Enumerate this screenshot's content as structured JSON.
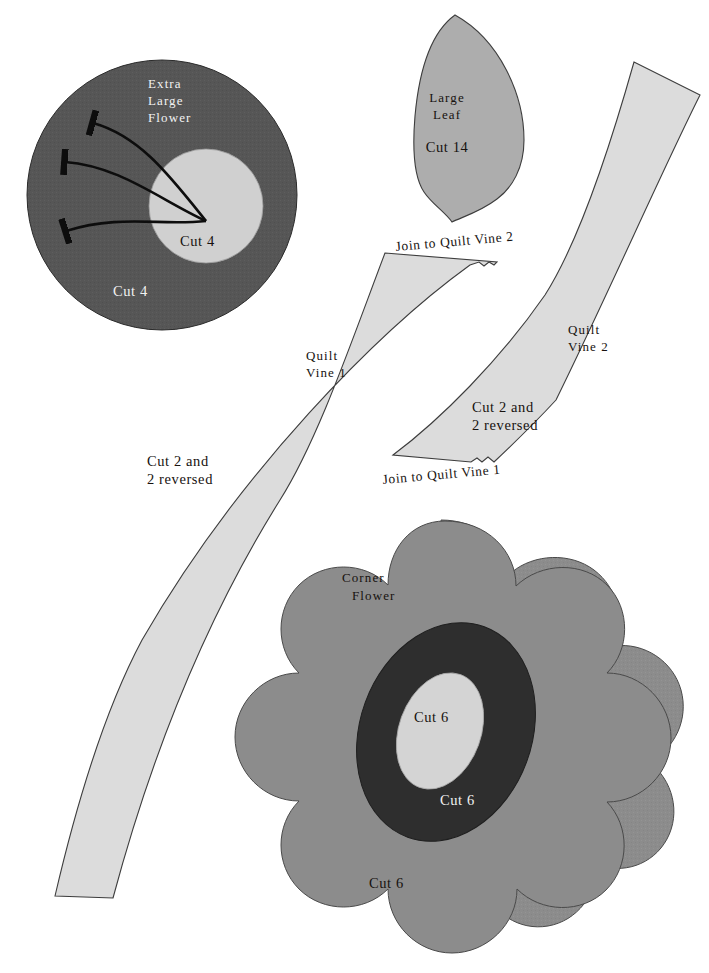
{
  "document": {
    "title": "Quilt Appliqué Pattern Templates",
    "background_color": "#ffffff"
  },
  "palette": {
    "outline": "#3d3d3d",
    "flower_dark_gray": "#565656",
    "flower_inner_light": "#d0d0d0",
    "leaf_gray": "#adadad",
    "vine_light": "#dcdcdc",
    "corner_petal_gray": "#8c8c8c",
    "corner_ring_dark": "#2e2e2e",
    "corner_center_light": "#d4d4d4",
    "text_dark": "#17120f",
    "text_light": "#f2f2f2"
  },
  "pieces": {
    "extra_large_flower": {
      "name_line1": "Extra",
      "name_line2": "Large",
      "name_line3": "Flower",
      "outer_cut_label": "Cut 4",
      "inner_cut_label": "Cut 4",
      "arrow_count": 3,
      "outer_fill": "#565656",
      "inner_fill": "#d0d0d0"
    },
    "large_leaf": {
      "name_line1": "Large",
      "name_line2": "Leaf",
      "cut_label": "Cut 14",
      "fill": "#adadad"
    },
    "quilt_vine_1": {
      "name_line1": "Quilt",
      "name_line2": "Vine 1",
      "cut_line1": "Cut 2 and",
      "cut_line2": "2 reversed",
      "join_label": "Join to Quilt Vine 2",
      "fill": "#dcdcdc"
    },
    "quilt_vine_2": {
      "name_line1": "Quilt",
      "name_line2": "Vine 2",
      "cut_line1": "Cut 2 and",
      "cut_line2": "2 reversed",
      "join_label": "Join to Quilt Vine 1",
      "fill": "#dcdcdc"
    },
    "corner_flower": {
      "name_line1": "Corner",
      "name_line2": "Flower",
      "petal_cut_label": "Cut 6",
      "ring_cut_label": "Cut 6",
      "center_cut_label": "Cut 6",
      "petal_fill": "#8c8c8c",
      "ring_fill": "#2e2e2e",
      "center_fill": "#d4d4d4"
    }
  }
}
